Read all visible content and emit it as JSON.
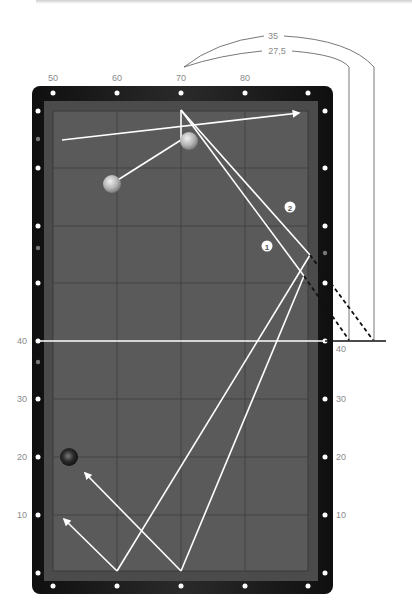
{
  "diagram": {
    "top_axis_labels": [
      {
        "text": "50",
        "x": 53
      },
      {
        "text": "60",
        "x": 117
      },
      {
        "text": "70",
        "x": 181
      },
      {
        "text": "80",
        "x": 245
      }
    ],
    "left_axis_labels": [
      {
        "text": "40",
        "y": 341
      },
      {
        "text": "30",
        "y": 399
      },
      {
        "text": "20",
        "y": 457
      },
      {
        "text": "10",
        "y": 515
      }
    ],
    "right_axis_labels": [
      {
        "text": "40",
        "y": 349
      },
      {
        "text": "30",
        "y": 399
      },
      {
        "text": "20",
        "y": 457
      },
      {
        "text": "10",
        "y": 515
      }
    ],
    "bracket_labels": {
      "outer": "35",
      "inner": "27,5"
    },
    "markers": [
      {
        "text": "1",
        "x": 267,
        "y": 246
      },
      {
        "text": "2",
        "x": 290,
        "y": 207
      }
    ],
    "balls": [
      {
        "name": "cue-ball-top",
        "x": 189,
        "y": 141,
        "color": "#b9b9b9"
      },
      {
        "name": "object-ball-white",
        "x": 112,
        "y": 184,
        "color": "#c6c6c6"
      },
      {
        "name": "object-ball-dark",
        "x": 69,
        "y": 457,
        "color": "#2a2a2a"
      }
    ],
    "colors": {
      "frame": "#1c1c1c",
      "cushion": "#4a4a4a",
      "felt": "#5b5b5b",
      "grid": "#3d3d3d",
      "path": "#ffffff",
      "diamond": "#ffffff",
      "label": "#8a8a8a"
    }
  }
}
